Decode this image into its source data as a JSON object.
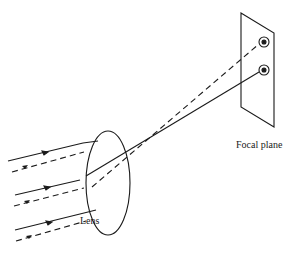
{
  "diagram": {
    "labels": {
      "focal_plane": "Focal plane",
      "lens": "Lens"
    },
    "colors": {
      "stroke": "#1a1a1a",
      "background": "#ffffff"
    },
    "elements": {
      "lens": {
        "shape": "ellipse",
        "cx": 108,
        "cy": 183,
        "rx": 22,
        "ry": 52
      },
      "focal_plane": {
        "shape": "parallelogram",
        "points": [
          [
            241,
            13
          ],
          [
            274,
            33
          ],
          [
            274,
            127
          ],
          [
            241,
            107
          ]
        ]
      },
      "focal_spots": [
        {
          "id": "spot-top",
          "cx": 264,
          "cy": 42,
          "ray_style": "dashed"
        },
        {
          "id": "spot-bottom",
          "cx": 264,
          "cy": 70,
          "ray_style": "solid"
        }
      ],
      "ray_bundles": [
        {
          "style": "solid",
          "count": 3,
          "converges_to": "spot-bottom"
        },
        {
          "style": "dashed",
          "count": 3,
          "converges_to": "spot-top"
        }
      ]
    }
  }
}
